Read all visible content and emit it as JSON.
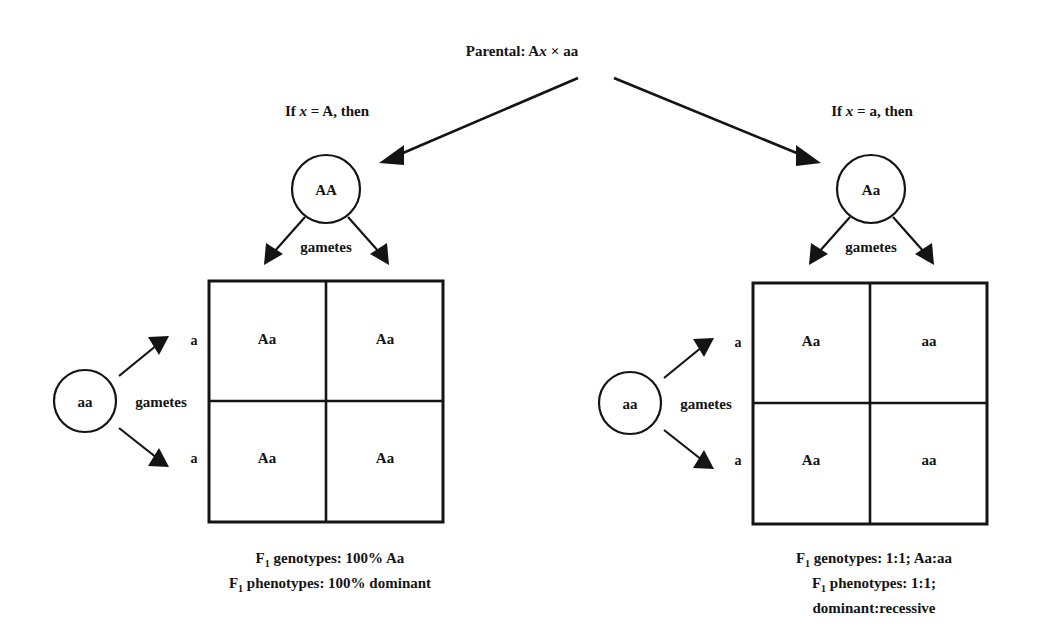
{
  "figure": {
    "title_text": "Parental: A",
    "parental": {
      "prefix": "Parental: A",
      "variable": "x",
      "operator": "×",
      "other_parent": "aa",
      "full_text": "Parental: Ax × aa"
    },
    "background_color": "#ffffff",
    "ink_color": "#141414"
  },
  "branches": {
    "left": {
      "condition_prefix": "If ",
      "condition_variable": "x",
      "condition_suffix": " = A, then",
      "condition_full": "If x = A, then",
      "parent_circle_label": "AA",
      "parent_gametes_label": "gametes",
      "tester_circle_label": "aa",
      "tester_gametes_label": "gametes",
      "row_labels": [
        "a",
        "a"
      ],
      "column_gametes": [
        "A",
        "A"
      ],
      "punnett_cells": [
        [
          "Aa",
          "Aa"
        ],
        [
          "Aa",
          "Aa"
        ]
      ],
      "caption_lines": [
        {
          "prefix": "F",
          "sub": "1",
          "rest": " genotypes: 100% Aa"
        },
        {
          "prefix": "F",
          "sub": "1",
          "rest": " phenotypes: 100% dominant"
        }
      ]
    },
    "right": {
      "condition_prefix": "If ",
      "condition_variable": "x",
      "condition_suffix": " = a, then",
      "condition_full": "If x = a, then",
      "parent_circle_label": "Aa",
      "parent_gametes_label": "gametes",
      "tester_circle_label": "aa",
      "tester_gametes_label": "gametes",
      "row_labels": [
        "a",
        "a"
      ],
      "column_gametes": [
        "A",
        "a"
      ],
      "punnett_cells": [
        [
          "Aa",
          "aa"
        ],
        [
          "Aa",
          "aa"
        ]
      ],
      "caption_lines": [
        {
          "prefix": "F",
          "sub": "1",
          "rest": " genotypes: 1:1; Aa:aa"
        },
        {
          "prefix": "F",
          "sub": "1",
          "rest": " phenotypes: 1:1;"
        },
        {
          "prefix": "",
          "sub": "",
          "rest": "dominant:recessive"
        }
      ]
    }
  }
}
